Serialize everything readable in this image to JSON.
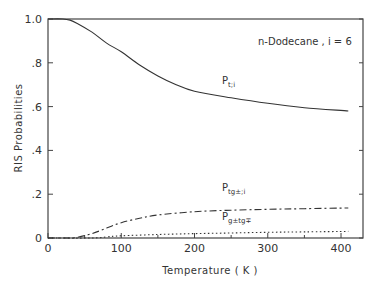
{
  "chart_data": {
    "type": "line",
    "title": "",
    "annotation": "n-Dodecane , i = 6",
    "xlabel": "Temperature ( K )",
    "ylabel": "RIS Probabilities",
    "xlim": [
      0,
      430
    ],
    "ylim": [
      0,
      1.0
    ],
    "x_ticks": [
      0,
      100,
      200,
      300,
      400
    ],
    "x_tick_labels": [
      "0",
      "100",
      "200",
      "300",
      "400"
    ],
    "y_ticks": [
      0,
      0.2,
      0.4,
      0.6,
      0.8,
      1.0
    ],
    "y_tick_labels": [
      "0",
      ".2",
      ".4",
      ".6",
      ".8",
      "1.0"
    ],
    "grid": false,
    "legend_position": "inline labels",
    "series": [
      {
        "name": "P_t;i",
        "label_main": "P",
        "label_sub": "t;i",
        "style": "solid",
        "x": [
          0,
          20,
          30,
          40,
          60,
          80,
          100,
          125,
          150,
          175,
          200,
          250,
          300,
          350,
          410
        ],
        "y": [
          1.0,
          1.0,
          0.995,
          0.98,
          0.94,
          0.89,
          0.85,
          0.79,
          0.74,
          0.7,
          0.67,
          0.64,
          0.615,
          0.595,
          0.58
        ]
      },
      {
        "name": "P_tg±;i",
        "label_main": "P",
        "label_sub": "tg±;i",
        "style": "dash-dot",
        "x": [
          0,
          30,
          40,
          60,
          80,
          100,
          125,
          150,
          200,
          250,
          300,
          350,
          410
        ],
        "y": [
          0.0,
          0.0,
          0.003,
          0.02,
          0.045,
          0.07,
          0.09,
          0.105,
          0.12,
          0.127,
          0.131,
          0.134,
          0.137
        ]
      },
      {
        "name": "P_g±tg∓",
        "label_main": "P",
        "label_sub": "g±tg∓",
        "style": "dotted",
        "x": [
          0,
          60,
          80,
          100,
          150,
          200,
          250,
          300,
          350,
          410
        ],
        "y": [
          0.0,
          0.0,
          0.005,
          0.01,
          0.016,
          0.02,
          0.023,
          0.026,
          0.028,
          0.03
        ]
      }
    ]
  }
}
